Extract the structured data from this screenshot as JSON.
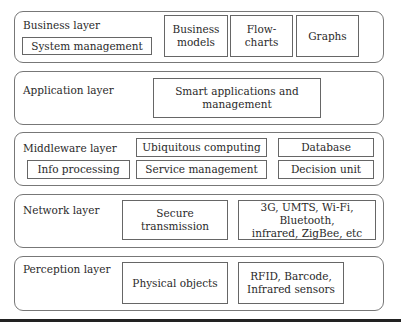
{
  "diagram": {
    "type": "layered-architecture",
    "layers": [
      {
        "id": "business",
        "label": "Business layer",
        "components": [
          {
            "label": "System management"
          },
          {
            "label": "Business\nmodels"
          },
          {
            "label": "Flow-\ncharts"
          },
          {
            "label": "Graphs"
          }
        ]
      },
      {
        "id": "application",
        "label": "Application layer",
        "components": [
          {
            "label": "Smart applications and\nmanagement"
          }
        ]
      },
      {
        "id": "middleware",
        "label": "Middleware layer",
        "components": [
          {
            "label": "Ubiquitous computing"
          },
          {
            "label": "Database"
          },
          {
            "label": "Info processing"
          },
          {
            "label": "Service management"
          },
          {
            "label": "Decision unit"
          }
        ]
      },
      {
        "id": "network",
        "label": "Network layer",
        "components": [
          {
            "label": "Secure\ntransmission"
          },
          {
            "label": "3G, UMTS, Wi-Fi, Bluetooth,\ninfrared, ZigBee, etc"
          }
        ]
      },
      {
        "id": "perception",
        "label": "Perception layer",
        "components": [
          {
            "label": "Physical objects"
          },
          {
            "label": "RFID, Barcode,\nInfrared sensors"
          }
        ]
      }
    ],
    "colors": {
      "border": "#777777",
      "text": "#2a2a2a",
      "background": "#ffffff",
      "rule": "#222222"
    }
  }
}
